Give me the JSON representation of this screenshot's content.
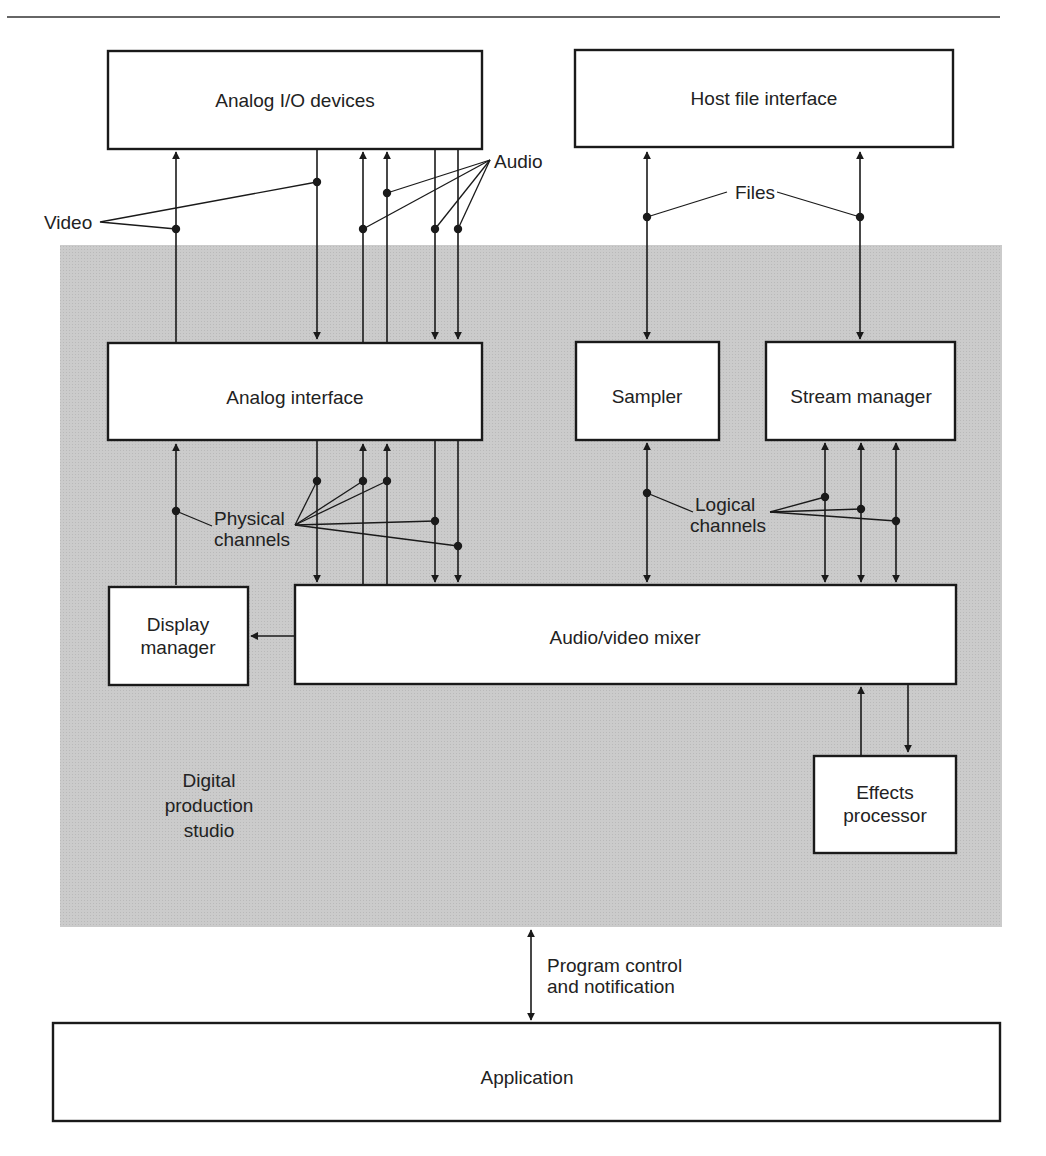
{
  "diagram": {
    "colors": {
      "studio_fill": "#c8c8c8",
      "box_fill": "#ffffff",
      "stroke": "#1a1a1a",
      "text": "#222222"
    },
    "regions": {
      "studio": {
        "label_lines": [
          "Digital",
          "production",
          "studio"
        ]
      }
    },
    "boxes": {
      "analog_io": {
        "label": "Analog I/O devices"
      },
      "host_file": {
        "label": "Host file interface"
      },
      "analog_interface": {
        "label": "Analog interface"
      },
      "sampler": {
        "label": "Sampler"
      },
      "stream_manager": {
        "label": "Stream manager"
      },
      "display_manager": {
        "label_lines": [
          "Display",
          "manager"
        ]
      },
      "mixer": {
        "label": "Audio/video mixer"
      },
      "effects": {
        "label_lines": [
          "Effects",
          "processor"
        ]
      },
      "application": {
        "label": "Application"
      }
    },
    "annotations": {
      "video": "Video",
      "audio": "Audio",
      "files": "Files",
      "physical_channels": [
        "Physical",
        "channels"
      ],
      "logical_channels": [
        "Logical",
        "channels"
      ],
      "program_control": [
        "Program control",
        "and notification"
      ]
    },
    "connections": [
      {
        "from": "analog_interface",
        "to": "analog_io",
        "type": "video",
        "direction": "up"
      },
      {
        "from": "analog_io",
        "to": "analog_interface",
        "type": "video",
        "direction": "down"
      },
      {
        "from": "analog_interface",
        "to": "analog_io",
        "type": "audio",
        "direction": "up",
        "count": 2
      },
      {
        "from": "analog_io",
        "to": "analog_interface",
        "type": "audio",
        "direction": "down",
        "count": 2
      },
      {
        "from": "host_file",
        "to": "sampler",
        "type": "files",
        "direction": "both"
      },
      {
        "from": "host_file",
        "to": "stream_manager",
        "type": "files",
        "direction": "both"
      },
      {
        "from": "display_manager",
        "to": "analog_interface",
        "type": "physical",
        "direction": "up"
      },
      {
        "from": "analog_interface",
        "to": "mixer",
        "type": "physical",
        "direction": "down",
        "count": 3
      },
      {
        "from": "mixer",
        "to": "analog_interface",
        "type": "physical",
        "direction": "up",
        "count": 2
      },
      {
        "from": "mixer",
        "to": "display_manager",
        "type": "display",
        "direction": "left"
      },
      {
        "from": "sampler",
        "to": "mixer",
        "type": "logical",
        "direction": "both"
      },
      {
        "from": "stream_manager",
        "to": "mixer",
        "type": "logical",
        "direction": "both",
        "count": 3
      },
      {
        "from": "effects",
        "to": "mixer",
        "direction": "up"
      },
      {
        "from": "mixer",
        "to": "effects",
        "direction": "down"
      },
      {
        "from": "application",
        "to": "studio",
        "type": "program control and notification",
        "direction": "both"
      }
    ]
  }
}
